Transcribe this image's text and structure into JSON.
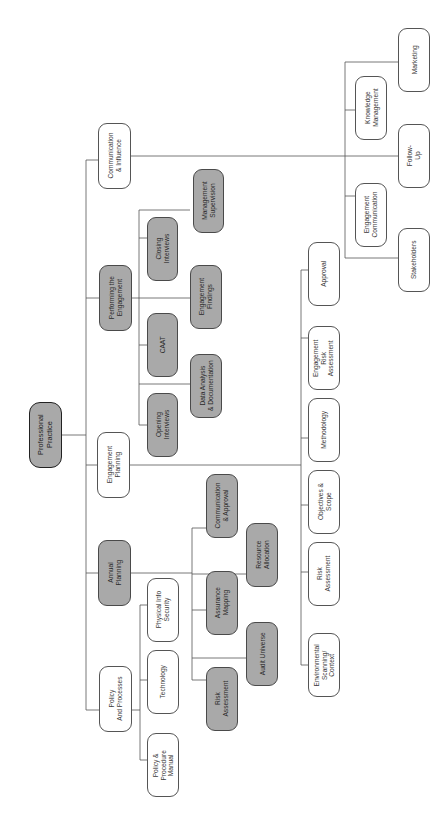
{
  "diagram": {
    "title": "Professional Practice",
    "orientation": "rotated-90-ccw",
    "colors": {
      "highlight_fill": "#a9a9a9",
      "default_fill": "#ffffff",
      "line": "#555555"
    },
    "root": {
      "label": "Professional\nPractice"
    },
    "branches": {
      "communication": {
        "label": "Communication\n& Influence",
        "children": {
          "stakeholders": "Stakeholders",
          "engagement_communication": "Engagement\nCommunication",
          "follow_up": "Follow-\nUp",
          "knowledge_management": "Knowledge\nManagement",
          "marketing": "Marketing"
        }
      },
      "performing": {
        "label": "Performing the\nEngagement",
        "children": {
          "opening_interviews": "Opening\nInterviews",
          "caat": "CAAT",
          "closing_interviews": "Closing\nInterviews",
          "data_analysis": "Data Analysis\n& Documentation",
          "engagement_findings": "Engagement\nFindings",
          "management_supervision": "Management\nSupervision"
        }
      },
      "engagement_planning": {
        "label": "Engagement\nPlanning",
        "children": {
          "environmental_scanning": "Environmental\nScanning/\nContext",
          "risk_assessment": "Risk\nAssessment",
          "objectives_scope": "Objectives &\nScope",
          "methodology": "Methodology",
          "engagement_risk_assessment": "Engagement\nRisk\nAssessment",
          "approval": "Approval"
        }
      },
      "annual_planning": {
        "label": "Annual\nPlanning",
        "children": {
          "risk_assessment": "Risk\nAssessment",
          "assurance_mapping": "Assurance\nMapping",
          "communication_approval": "Communication\n& Approval",
          "audit_universe": "Audit Universe",
          "resource_allocation": "Resource\nAllocation"
        }
      },
      "policy": {
        "label": "Policy\nAnd Processes",
        "children": {
          "procedure_manual": "Policy &\nProcedure\nManual",
          "technology": "Technology",
          "physical_info_security": "Physical Info\nSecurity"
        }
      }
    }
  }
}
